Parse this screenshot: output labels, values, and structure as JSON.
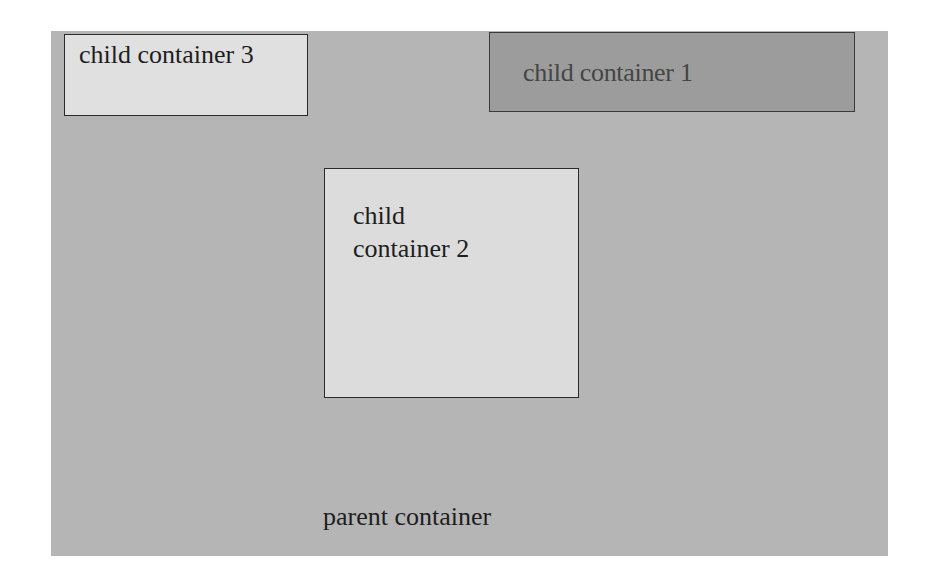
{
  "diagram": {
    "parent": {
      "label": "parent container",
      "color": "#b5b5b5"
    },
    "children": [
      {
        "id": "child-container-3",
        "label": "child container 3",
        "color": "#e0e0e0"
      },
      {
        "id": "child-container-1",
        "label": "child container 1",
        "color": "#9c9c9c"
      },
      {
        "id": "child-container-2",
        "label_line1": "child",
        "label_line2": "container 2",
        "color": "#dcdcdc"
      }
    ]
  }
}
